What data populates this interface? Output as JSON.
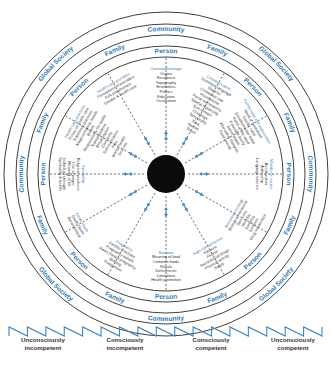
{
  "rings": {
    "outer": {
      "label": "Global Society",
      "repeat": 4
    },
    "community": {
      "label": "Community",
      "repeat": 4
    },
    "family": {
      "label": "Family",
      "repeat": 8
    },
    "person": {
      "label": "Person",
      "repeat": 8
    }
  },
  "sections": [
    {
      "title": "Overview/heritage",
      "items": [
        "Origins",
        "Residence",
        "Topography",
        "Economics",
        "Politics",
        "Education",
        "Occupation"
      ]
    },
    {
      "title": "Communication",
      "items": [
        "Dominant language",
        "Dialects",
        "Contextual use",
        "Volume/tone",
        "Facial expressions",
        "Spatial distancing",
        "Eye contact",
        "Greetings",
        "Temporality",
        "Time",
        "Names",
        "Touch"
      ]
    },
    {
      "title": "Family roles and organization",
      "items": [
        "Head of household",
        "Gender roles",
        "Developmental tasks",
        "Roles of the aged",
        "Extended family",
        "Social status",
        "Alternative lifestyles",
        "Child rearing"
      ]
    },
    {
      "title": "Workforce issues",
      "items": [
        "Acculturation",
        "Autonomy",
        "Language barriers"
      ]
    },
    {
      "title": "Biocultural ecology",
      "items": [
        "Biological variations",
        "Skin color",
        "Heredity",
        "Genetics",
        "Endemic",
        "Drug metabolism"
      ]
    },
    {
      "title": "High-risk behaviors",
      "items": [
        "Tobacco",
        "Alcohol",
        "Recreational drugs",
        "Physical activity",
        "Safety"
      ]
    },
    {
      "title": "Nutrition",
      "items": [
        "Meaning of food",
        "Common foods",
        "Rituals",
        "Deficiencies",
        "Limitations",
        "Health promotion"
      ]
    },
    {
      "title": "Pregnancy",
      "items": [
        "Fertility practices",
        "Pregnancy beliefs",
        "Views toward pregnancy",
        "Birthing",
        "Postpartum"
      ]
    },
    {
      "title": "Death rituals",
      "items": [
        "Death rituals",
        "Bereavement"
      ]
    },
    {
      "title": "Spirituality",
      "items": [
        "Religious practices",
        "Use of prayer",
        "Meaning of life",
        "Individual strength",
        "Spirituality & health"
      ]
    },
    {
      "title": "Health-care practices",
      "items": [
        "Focus on health care",
        "Traditional practices",
        "Magicoreligious beliefs",
        "Beliefs",
        "Responsibility for health",
        "Transplantation",
        "Rehabilitation",
        "Chronicity",
        "Self-medication",
        "Pain",
        "Mental health",
        "Sick role"
      ]
    },
    {
      "title": "Health-care providers",
      "items": [
        "Perceptions of providers",
        "Folk practitioners",
        "Gender & health care"
      ]
    }
  ],
  "continuum": {
    "stages": [
      {
        "line1": "Unconsciously",
        "line2": "incompetent"
      },
      {
        "line1": "Consciously",
        "line2": "incompetent"
      },
      {
        "line1": "Consciously",
        "line2": "competent"
      },
      {
        "line1": "Unconsciously",
        "line2": "competent"
      }
    ]
  },
  "colors": {
    "accent": "#2f7cb8",
    "center": "#0b0b0b",
    "line": "#2a2a2a"
  }
}
